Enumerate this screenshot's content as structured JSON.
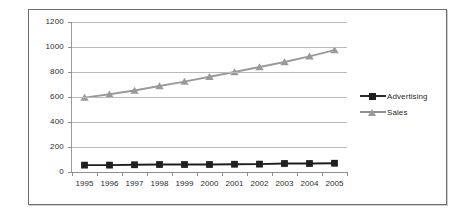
{
  "chart_data": {
    "type": "line",
    "title": "",
    "subtitle": "",
    "xlabel": "",
    "ylabel": "",
    "categories": [
      "1995",
      "1996",
      "1997",
      "1998",
      "1999",
      "2000",
      "2001",
      "2002",
      "2003",
      "2004",
      "2005"
    ],
    "ylim": [
      0,
      1200
    ],
    "yticks": [
      0,
      200,
      400,
      600,
      800,
      1000,
      1200
    ],
    "ytick_labels": [
      "0",
      "200",
      "400",
      "600",
      "800",
      "1000",
      "1200"
    ],
    "grid": true,
    "legend_position": "right",
    "series": [
      {
        "name": "Advertising",
        "color": "#1f1f1f",
        "marker": "square",
        "values": [
          55,
          55,
          58,
          60,
          60,
          60,
          62,
          63,
          68,
          68,
          70
        ]
      },
      {
        "name": "Sales",
        "color": "#9a9a9a",
        "marker": "triangle",
        "values": [
          595,
          622,
          652,
          688,
          723,
          762,
          800,
          840,
          880,
          925,
          975
        ]
      }
    ]
  },
  "legend": {
    "items": [
      {
        "label": "Advertising",
        "key": "square-marker-icon"
      },
      {
        "label": "Sales",
        "key": "triangle-marker-icon"
      }
    ]
  },
  "colors": {
    "advertising": "#1f1f1f",
    "sales": "#9a9a9a",
    "gridline": "#b9b9b9",
    "axis": "#8d8d8d",
    "frame": "#6f6f6f",
    "text": "#2b2b2b",
    "background": "#ffffff"
  }
}
